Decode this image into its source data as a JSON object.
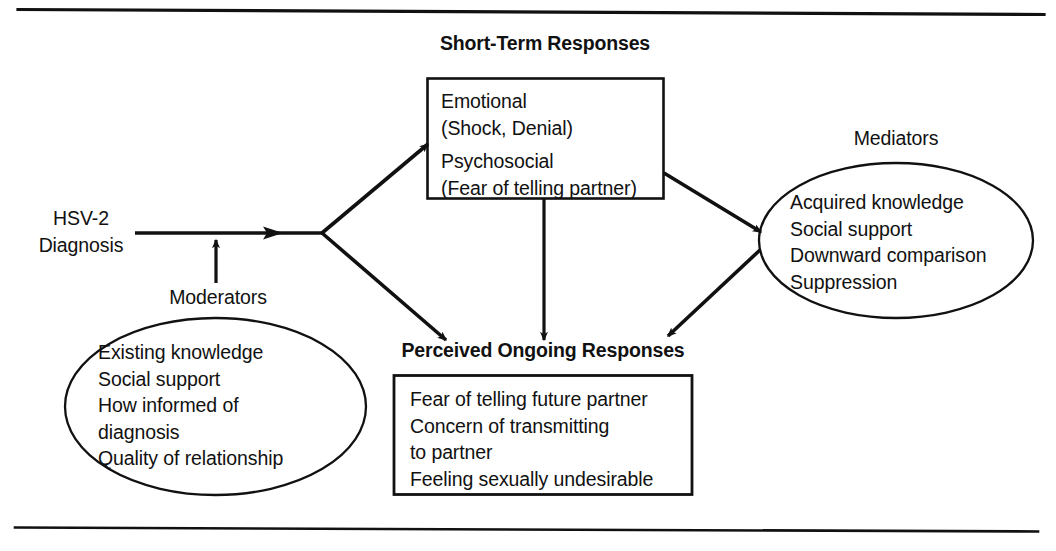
{
  "figure": {
    "rules": {
      "top_rule": "horizontal-rule",
      "bottom_rule": "horizontal-rule"
    }
  },
  "nodes": {
    "source": {
      "name": "HSV-2 Diagnosis",
      "line1": "HSV-2",
      "line2": "Diagnosis"
    },
    "moderators": {
      "label": "Moderators",
      "items": [
        "Existing knowledge",
        "Social support",
        "How informed of",
        "diagnosis",
        "Quality of relationship"
      ]
    },
    "short_term": {
      "heading": "Short-Term Responses",
      "items": [
        "Emotional",
        "(Shock, Denial)",
        "Psychosocial",
        "(Fear of telling partner)"
      ]
    },
    "mediators": {
      "label": "Mediators",
      "items": [
        "Acquired knowledge",
        "Social support",
        "Downward comparison",
        "Suppression"
      ]
    },
    "ongoing": {
      "heading": "Perceived Ongoing Responses",
      "items": [
        "Fear of telling future partner",
        "Concern of transmitting",
        "to partner",
        "Feeling sexually undesirable"
      ]
    }
  },
  "edges": [
    {
      "id": "diagnosis-to-junction",
      "from": "HSV-2 Diagnosis",
      "to": "junction",
      "style": "arrow-right"
    },
    {
      "id": "moderators-to-path",
      "from": "Moderators",
      "to": "HSV-2 Diagnosis path",
      "style": "arrow-up"
    },
    {
      "id": "junction-to-short-term",
      "from": "junction",
      "to": "Short-Term Responses",
      "style": "arrow-up-right"
    },
    {
      "id": "junction-to-ongoing",
      "from": "junction",
      "to": "Perceived Ongoing Responses",
      "style": "arrow-down-right"
    },
    {
      "id": "short-term-to-ongoing",
      "from": "Short-Term Responses",
      "to": "Perceived Ongoing Responses",
      "style": "arrow-down"
    },
    {
      "id": "short-term-to-mediators",
      "from": "Short-Term Responses",
      "to": "Mediators",
      "style": "arrow-down-right"
    },
    {
      "id": "mediators-to-ongoing",
      "from": "Mediators",
      "to": "Perceived Ongoing Responses",
      "style": "arrow-down-left"
    }
  ],
  "colors": {
    "ink": "#111111",
    "background": "#ffffff"
  }
}
